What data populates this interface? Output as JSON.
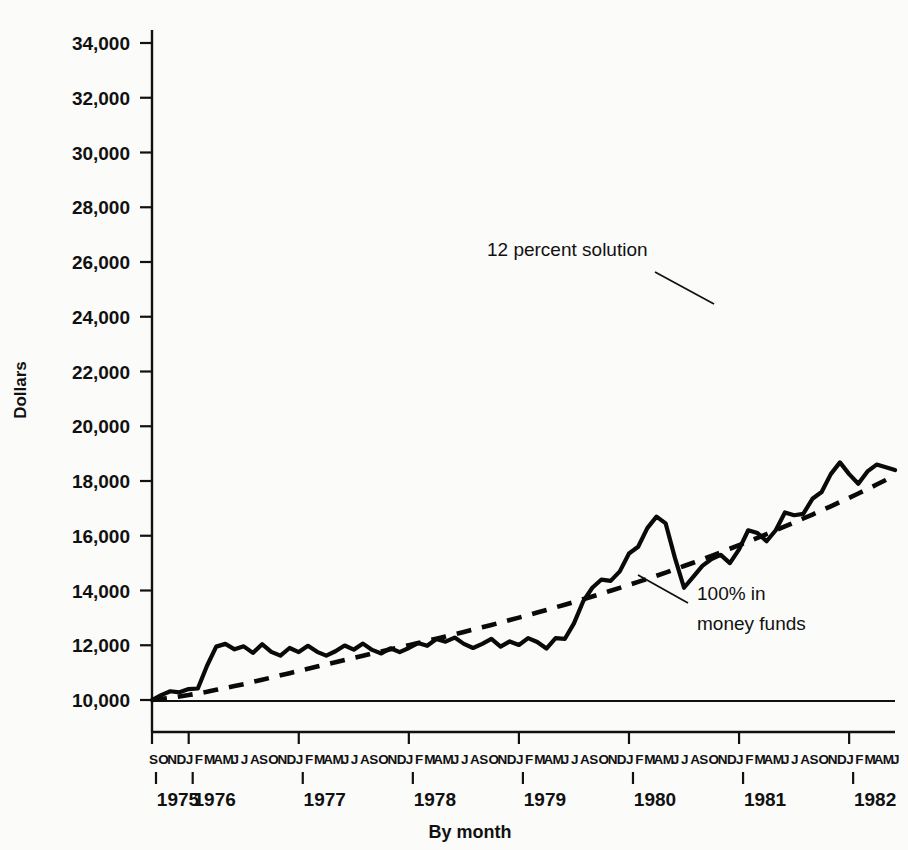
{
  "chart_data": {
    "type": "line",
    "title": "",
    "xlabel": "By month",
    "ylabel": "Dollars",
    "ylim": [
      9200,
      35000
    ],
    "yticks": [
      10000,
      12000,
      14000,
      16000,
      18000,
      20000,
      22000,
      24000,
      26000,
      28000,
      30000,
      32000,
      34000
    ],
    "ytick_labels": [
      "10,000",
      "12,000",
      "14,000",
      "16,000",
      "18,000",
      "20,000",
      "22,000",
      "24,000",
      "26,000",
      "28,000",
      "30,000",
      "32,000",
      "34,000"
    ],
    "grid": false,
    "legend_position": "inline-annotations",
    "reference_line": 9800,
    "x_start": "1975-09",
    "x_end": "1982-06",
    "year_labels": [
      "1975",
      "1976",
      "1977",
      "1978",
      "1979",
      "1980",
      "1981",
      "1982"
    ],
    "month_letter_groups": [
      {
        "year": "1975",
        "letters": "SOND"
      },
      {
        "year": "1976",
        "letters": "JFMAMJJASOND"
      },
      {
        "year": "1977",
        "letters": "JFMAMJJASOND"
      },
      {
        "year": "1978",
        "letters": "JFMAMJJASOND"
      },
      {
        "year": "1979",
        "letters": "JFMAMJJASOND"
      },
      {
        "year": "1980",
        "letters": "JFMAMJJASOND"
      },
      {
        "year": "1981",
        "letters": "JFMAMJJASOND"
      },
      {
        "year": "1982",
        "letters": "JFMAMJ"
      }
    ],
    "annotations": [
      {
        "name": "12-percent-solution",
        "text": "12 percent solution",
        "lines": [
          "12 percent solution"
        ]
      },
      {
        "name": "100-percent-money-funds",
        "text": "100% in money funds",
        "lines": [
          "100% in",
          "money funds"
        ]
      }
    ],
    "series": [
      {
        "name": "12 percent solution",
        "style": "solid",
        "values": [
          10000,
          10180,
          10320,
          10280,
          10400,
          10420,
          11250,
          11950,
          12050,
          11850,
          11960,
          11720,
          12040,
          11760,
          11620,
          11900,
          11750,
          11980,
          11760,
          11620,
          11780,
          11990,
          11840,
          12060,
          11830,
          11700,
          11890,
          11750,
          11900,
          12080,
          11980,
          12230,
          12130,
          12280,
          12050,
          11900,
          12050,
          12230,
          11950,
          12140,
          12010,
          12260,
          12120,
          11880,
          12260,
          12230,
          12800,
          13600,
          14100,
          14400,
          14350,
          14700,
          15350,
          15600,
          16280,
          16700,
          16450,
          15200,
          14100,
          14500,
          14900,
          15150,
          15300,
          15000,
          15500,
          16200,
          16100,
          15800,
          16200,
          16850,
          16750,
          16800,
          17350,
          17600,
          18250,
          18680,
          18250,
          17900,
          18350,
          18600,
          18500,
          18400,
          18700,
          19100,
          19050,
          19600,
          19050,
          18950,
          19100,
          19400,
          20200,
          21200,
          22400,
          23350,
          24400,
          25050,
          25950,
          26050,
          24900,
          25100,
          25600,
          26100,
          26600,
          27050,
          27500,
          27600,
          28300,
          28550,
          29100,
          29650,
          29900,
          30250,
          30700,
          30900,
          30650,
          31150,
          31400,
          31600,
          32000,
          32220
        ]
      },
      {
        "name": "100% in money funds",
        "style": "dashed",
        "values": [
          10000,
          10020,
          10050,
          10080,
          10110,
          10145,
          10180,
          10215,
          10255,
          10295,
          10335,
          10380,
          10425,
          10470,
          10520,
          10570,
          10620,
          10675,
          10730,
          10785,
          10845,
          10905,
          10965,
          11030,
          11095,
          11160,
          11230,
          11300,
          11375,
          11450,
          11525,
          11605,
          11685,
          11770,
          11855,
          11945,
          12035,
          12125,
          12220,
          12320,
          12420,
          12525,
          12630,
          12740,
          12850,
          12965,
          13080,
          13200,
          13320,
          13445,
          13575,
          13705,
          13840,
          13980,
          14120,
          14265,
          14410,
          14560,
          14715,
          14870,
          15030,
          15195,
          15360,
          15530,
          15705,
          15880,
          16060,
          16245,
          16430,
          16620,
          16815,
          17010,
          17210,
          17415,
          17620,
          17830,
          18045,
          18265,
          18490,
          18720,
          18950,
          19190,
          19430,
          19680,
          19930,
          20190,
          20450,
          20720,
          20990,
          21270,
          21550,
          21840,
          22130,
          22430,
          22730,
          23040,
          23350,
          23670,
          23990,
          24320,
          24650,
          24990,
          25330,
          25680,
          26030,
          26390,
          26750,
          27120,
          27490,
          27870,
          28250,
          28640,
          29030,
          29430,
          29830,
          30240,
          30650,
          31070
        ]
      }
    ],
    "dashed_display_values": [
      10000,
      10040,
      10080,
      10130,
      10180,
      10240,
      10300,
      10370,
      10440,
      10510,
      10580,
      10660,
      10740,
      10820,
      10900,
      10980,
      11060,
      11140,
      11220,
      11300,
      11380,
      11460,
      11540,
      11620,
      11700,
      11775,
      11850,
      11925,
      12000,
      12080,
      12160,
      12240,
      12320,
      12400,
      12485,
      12570,
      12655,
      12740,
      12830,
      12920,
      13010,
      13100,
      13195,
      13290,
      13385,
      13480,
      13580,
      13680,
      13780,
      13885,
      13990,
      14095,
      14205,
      14315,
      14425,
      14540,
      14655,
      14775,
      14895,
      15015,
      15140,
      15265,
      15395,
      15525,
      15655,
      15790,
      15925,
      16060,
      16200,
      16340,
      16485,
      16630,
      16775,
      16925,
      17075,
      17230,
      17385,
      17545,
      17705,
      17870,
      18035,
      18200,
      18370,
      18545,
      18720,
      18900,
      19080,
      19265,
      19450,
      19640,
      19830,
      20025,
      20220,
      20420,
      20620,
      20825,
      21030,
      21240,
      21450,
      21665,
      21880,
      22100,
      22320,
      22545,
      22770,
      23000,
      23230,
      23465,
      23700,
      23940,
      24180,
      24425,
      24670,
      24920,
      25170,
      25425,
      25680,
      25940
    ]
  },
  "axis": {
    "y_title": "Dollars",
    "x_title": "By month"
  }
}
